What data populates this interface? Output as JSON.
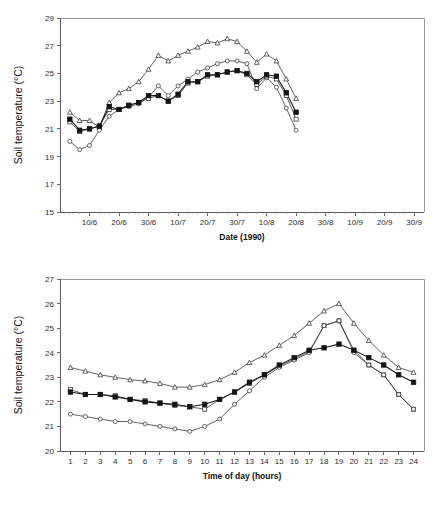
{
  "chart_data": [
    {
      "type": "line",
      "id": "top",
      "title": "",
      "xlabel": "Date (1990)",
      "ylabel": "Soil temperature (°C)",
      "ylim": [
        15,
        29
      ],
      "yticks": [
        15,
        17,
        19,
        21,
        23,
        25,
        27,
        29
      ],
      "grid": false,
      "legend": "none",
      "xlabel_ticks": [
        "10/6",
        "20/6",
        "30/6",
        "10/7",
        "20/7",
        "30/7",
        "10/8",
        "20/8",
        "30/8",
        "10/9",
        "20/9",
        "30/9"
      ],
      "x": [
        1,
        2,
        3,
        4,
        5,
        6,
        7,
        8,
        9,
        10,
        11,
        12,
        13,
        14,
        15,
        16,
        17,
        18,
        19,
        20,
        21,
        22,
        23,
        24,
        25,
        26,
        27,
        28,
        29,
        30,
        31,
        32,
        33,
        34,
        35,
        36
      ],
      "x_tick_indices": [
        3,
        6,
        9,
        12,
        15,
        18,
        21,
        24,
        27,
        30,
        33,
        36
      ],
      "series": [
        {
          "name": "series-triangle-open",
          "marker": "triangle-open",
          "values": [
            22.2,
            21.6,
            21.6,
            21.1,
            22.9,
            23.6,
            23.9,
            24.4,
            25.3,
            26.3,
            25.9,
            26.3,
            26.6,
            26.9,
            27.3,
            27.2,
            27.5,
            27.3,
            26.6,
            25.8,
            26.4,
            25.9,
            24.6,
            23.2,
            23.0,
            23.0,
            23.0,
            23.0,
            23.0,
            23.0,
            23.0,
            23.0,
            23.0,
            23.0,
            23.0,
            23.0
          ]
        },
        {
          "name": "series-circle-open",
          "marker": "circle-open",
          "values": [
            20.1,
            19.5,
            19.8,
            20.9,
            21.9,
            22.4,
            22.6,
            22.8,
            23.3,
            24.1,
            23.4,
            24.1,
            24.6,
            25.1,
            25.4,
            25.7,
            25.9,
            25.9,
            25.7,
            23.9,
            24.7,
            24.0,
            22.5,
            20.9,
            20.9,
            20.9,
            20.9,
            20.9,
            20.9,
            20.9,
            20.9,
            20.9,
            20.9,
            20.9,
            20.9,
            20.9
          ]
        },
        {
          "name": "series-square-open",
          "marker": "square-open",
          "values": [
            21.5,
            20.8,
            21.0,
            21.2,
            22.4,
            22.4,
            22.7,
            22.9,
            23.2,
            23.4,
            23.0,
            23.4,
            24.3,
            24.4,
            24.8,
            24.9,
            25.1,
            25.2,
            24.9,
            24.2,
            24.8,
            24.6,
            23.4,
            21.7,
            21.7,
            21.7,
            21.7,
            21.7,
            21.7,
            21.7,
            21.7,
            21.7,
            21.7,
            21.7,
            21.7,
            21.7
          ]
        },
        {
          "name": "series-square-filled",
          "marker": "square-filled",
          "values": [
            21.7,
            20.9,
            21.0,
            21.2,
            22.6,
            22.4,
            22.7,
            22.9,
            23.4,
            23.4,
            23.0,
            23.5,
            24.4,
            24.4,
            24.9,
            24.9,
            25.1,
            25.2,
            25.0,
            24.4,
            24.9,
            24.8,
            23.6,
            22.2,
            21.8,
            21.8,
            21.8,
            21.8,
            21.8,
            21.8,
            21.8,
            21.8,
            21.8,
            21.8,
            21.8,
            21.8
          ]
        }
      ]
    },
    {
      "type": "line",
      "id": "bottom",
      "title": "",
      "xlabel": "Time of day (hours)",
      "ylabel": "Soil temperature (°C)",
      "ylim": [
        20,
        27
      ],
      "yticks": [
        20,
        21,
        22,
        23,
        24,
        25,
        26,
        27
      ],
      "grid": false,
      "legend": "none",
      "x": [
        1,
        2,
        3,
        4,
        5,
        6,
        7,
        8,
        9,
        10,
        11,
        12,
        13,
        14,
        15,
        16,
        17,
        18,
        19,
        20,
        21,
        22,
        23,
        24
      ],
      "series": [
        {
          "name": "series-triangle-open",
          "marker": "triangle-open",
          "values": [
            23.4,
            23.25,
            23.1,
            23.0,
            22.9,
            22.85,
            22.75,
            22.6,
            22.6,
            22.7,
            22.9,
            23.2,
            23.6,
            23.9,
            24.3,
            24.7,
            25.2,
            25.7,
            26.0,
            25.2,
            24.5,
            23.9,
            23.4,
            23.2
          ]
        },
        {
          "name": "series-square-open",
          "marker": "square-open",
          "values": [
            22.5,
            22.3,
            22.3,
            22.25,
            22.1,
            22.05,
            21.95,
            21.85,
            21.8,
            21.7,
            22.1,
            22.4,
            22.75,
            23.1,
            23.45,
            23.75,
            24.05,
            25.1,
            25.3,
            24.1,
            23.5,
            23.1,
            22.3,
            21.7
          ]
        },
        {
          "name": "series-circle-open",
          "marker": "circle-open",
          "values": [
            21.5,
            21.4,
            21.3,
            21.2,
            21.2,
            21.1,
            21.0,
            20.9,
            20.8,
            21.0,
            21.3,
            21.9,
            22.45,
            23.0,
            23.4,
            23.7,
            24.0,
            25.1,
            25.3,
            24.0,
            23.5,
            23.1,
            22.3,
            21.7
          ]
        },
        {
          "name": "series-square-filled",
          "marker": "square-filled",
          "values": [
            22.4,
            22.3,
            22.3,
            22.2,
            22.1,
            22.0,
            21.95,
            21.9,
            21.8,
            21.9,
            22.1,
            22.4,
            22.8,
            23.1,
            23.5,
            23.8,
            24.1,
            24.2,
            24.35,
            24.1,
            23.8,
            23.5,
            23.1,
            22.8
          ]
        }
      ]
    }
  ]
}
